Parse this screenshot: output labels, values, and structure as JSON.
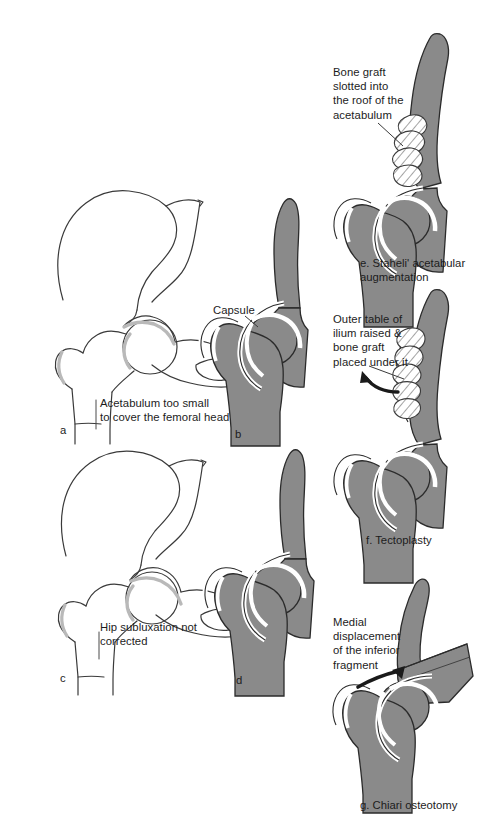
{
  "figure": {
    "background_color": "#ffffff",
    "bone_fill_color": "#8a8a8a",
    "outline_color": "#2b2b2b",
    "capsule_color": "#ffffff",
    "cartilage_color": "#c9c9c9",
    "text_color": "#1c1c1c"
  },
  "panels": [
    {
      "id": "a",
      "letter": "a",
      "annotation": "Acetabulum too small\nto cover the femoral head",
      "caption": "",
      "style": "line-drawing"
    },
    {
      "id": "b",
      "letter": "b",
      "annotation": "Capsule",
      "caption": "",
      "style": "shaded-section"
    },
    {
      "id": "c",
      "letter": "c",
      "annotation": "Hip subluxation not\ncorrected",
      "caption": "",
      "style": "line-drawing"
    },
    {
      "id": "d",
      "letter": "d",
      "annotation": "",
      "caption": "",
      "style": "shaded-section"
    },
    {
      "id": "e",
      "letter": "e",
      "annotation": "Bone graft\nslotted into\nthe roof of the\nacetabulum",
      "caption": "e. Staheli' acetabular\naugmentation",
      "style": "shaded-section-with-graft"
    },
    {
      "id": "f",
      "letter": "f",
      "annotation": "Outer table of\nilium raised &\nbone graft\nplaced under it",
      "caption": "f. Tectoplasty",
      "style": "shaded-section-with-graft"
    },
    {
      "id": "g",
      "letter": "g",
      "annotation": "Medial\ndisplacement\nof the inferior\nfragment",
      "caption": "g. Chiari osteotomy",
      "style": "shaded-section-osteotomy"
    }
  ]
}
